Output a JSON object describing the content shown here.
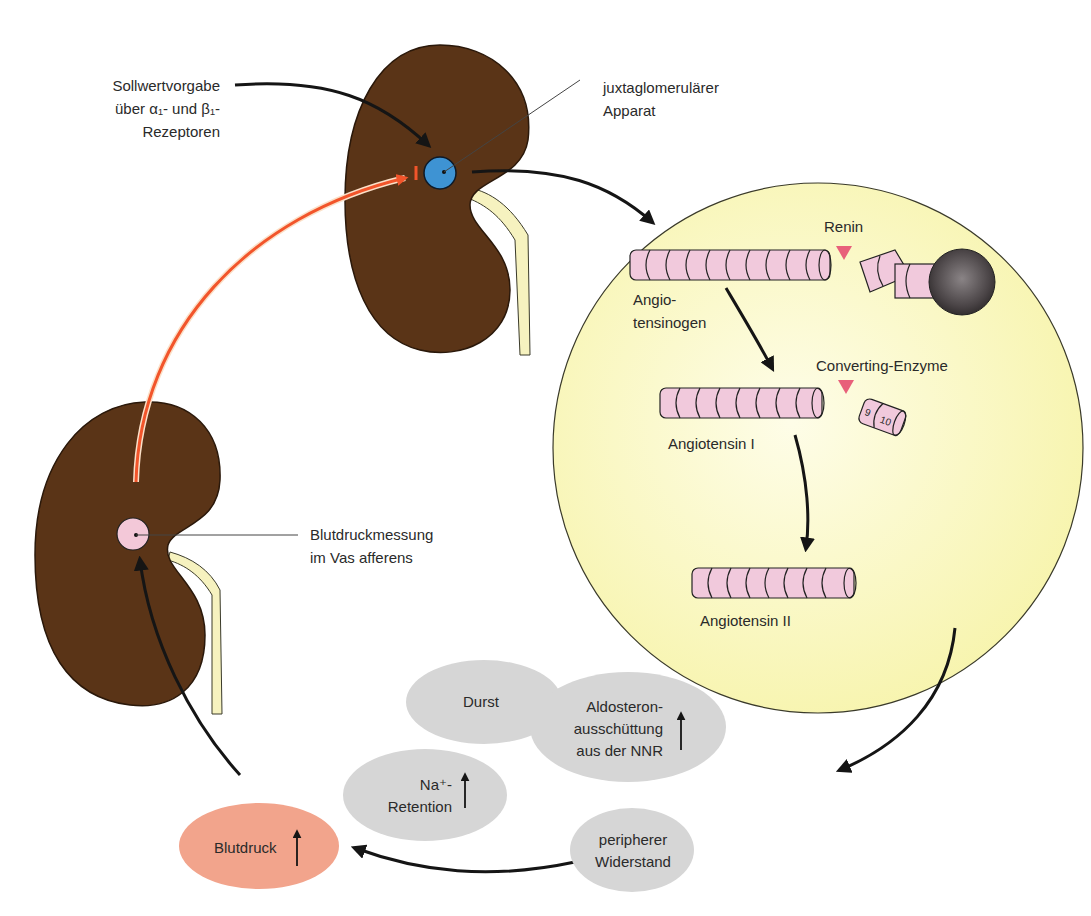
{
  "colors": {
    "kidney": "#5a3417",
    "kidney_outline": "#2a180a",
    "ureter": "#f6f2bf",
    "jga": "#3e93d3",
    "sensor": "#f3c8d8",
    "circle_bg": "#f8f6b8",
    "peptide": "#f1c9dc",
    "enzyme_marker": "#e8607a",
    "sphere": "#4a4446",
    "red_arrow": "#f2552b",
    "grey_blob": "#d6d6d6",
    "blutdruck_blob": "#f2a48c",
    "arrow": "#151515"
  },
  "labels": {
    "sollwert": [
      "Sollwertvorgabe",
      "über α₁- und β₁-",
      "Rezeptoren"
    ],
    "jga": [
      "juxtaglomerulärer",
      "Apparat"
    ],
    "blutdruckmessung": [
      "Blutdruckmessung",
      "im Vas afferens"
    ],
    "renin": "Renin",
    "angiotensinogen": [
      "Angio-",
      "tensinogen"
    ],
    "converting_enzyme": "Converting-Enzyme",
    "angiotensin1": "Angiotensin I",
    "angiotensin2": "Angiotensin II",
    "fragment_numbers": [
      "9",
      "10"
    ],
    "durst": "Durst",
    "aldosteron": [
      "Aldosteron-",
      "ausschüttung",
      "aus der NNR"
    ],
    "na_retention": [
      "Na⁺-",
      "Retention"
    ],
    "peripherer_widerstand": [
      "peripherer",
      "Widerstand"
    ],
    "blutdruck": "Blutdruck"
  },
  "indicators": {
    "increase_arrow": "↑"
  }
}
